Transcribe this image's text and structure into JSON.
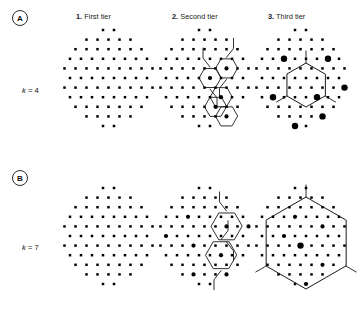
{
  "figure": {
    "background": "#ffffff",
    "ink": "#000000",
    "line_color": "#1a1a1a"
  },
  "panels": [
    {
      "id": "A",
      "badge_label": "A",
      "row_label_k": "k",
      "row_label_eq": " = ",
      "row_label_value": "4",
      "row_label_full": "k = 4",
      "cluster_size": 4
    },
    {
      "id": "B",
      "badge_label": "B",
      "row_label_k": "k",
      "row_label_eq": " = ",
      "row_label_value": "7",
      "row_label_full": "k = 7",
      "cluster_size": 7
    }
  ],
  "columns": [
    {
      "number": "1.",
      "label": "First tier"
    },
    {
      "number": "2.",
      "label": "Second tier"
    },
    {
      "number": "3.",
      "label": "Third tier"
    }
  ],
  "chart_data": {
    "type": "scatter",
    "title": "",
    "lattice": {
      "dx": 11,
      "dy": 9.6,
      "dot_radius_small": 1.25,
      "dot_radius_medium": 2.1,
      "dot_radius_large": 3.2,
      "rows": [
        {
          "y_index": 0,
          "count": 2,
          "x_start": 3.0
        },
        {
          "y_index": 1,
          "count": 5,
          "x_start": 1.5
        },
        {
          "y_index": 2,
          "count": 7,
          "x_start": 0.5
        },
        {
          "y_index": 3,
          "count": 8,
          "x_start": 0.0
        },
        {
          "y_index": 4,
          "count": 9,
          "x_start": -0.5
        },
        {
          "y_index": 5,
          "count": 8,
          "x_start": 0.0
        },
        {
          "y_index": 6,
          "count": 9,
          "x_start": -0.5
        },
        {
          "y_index": 7,
          "count": 8,
          "x_start": 0.0
        },
        {
          "y_index": 8,
          "count": 7,
          "x_start": 0.5
        },
        {
          "y_index": 9,
          "count": 5,
          "x_start": 1.5
        },
        {
          "y_index": 10,
          "count": 2,
          "x_start": 3.0
        }
      ]
    },
    "panel_A": {
      "k": 4,
      "tier1": {
        "marked": []
      },
      "tier2": {
        "cell_radius": 11.0,
        "centers": [
          {
            "cx": 44.5,
            "cy": 43.0
          },
          {
            "cx": 61.5,
            "cy": 33.6
          },
          {
            "cx": 44.5,
            "cy": 81.0
          },
          {
            "cx": 61.5,
            "cy": 90.5
          },
          {
            "cx": 53.0,
            "cy": 62.0
          }
        ],
        "marked_dots": [
          {
            "cx": 44.5,
            "cy": 43.0,
            "size": "medium"
          },
          {
            "cx": 61.5,
            "cy": 33.6,
            "size": "medium"
          },
          {
            "cx": 53.0,
            "cy": 62.0,
            "size": "medium"
          },
          {
            "cx": 44.5,
            "cy": 81.0,
            "size": "medium"
          },
          {
            "cx": 61.5,
            "cy": 90.5,
            "size": "medium"
          }
        ]
      },
      "tier3": {
        "cell_radius": 22.0,
        "marked_dots": [
          {
            "cx": 22.0,
            "cy": 24.0,
            "size": "large"
          },
          {
            "cx": 66.0,
            "cy": 24.0,
            "size": "large"
          },
          {
            "cx": 11.0,
            "cy": 62.0,
            "size": "large"
          },
          {
            "cx": 55.0,
            "cy": 62.0,
            "size": "large"
          },
          {
            "cx": 88.0,
            "cy": 62.0,
            "size": "large"
          },
          {
            "cx": 22.0,
            "cy": 100.0,
            "size": "large"
          },
          {
            "cx": 66.0,
            "cy": 100.0,
            "size": "large"
          }
        ]
      }
    },
    "panel_B": {
      "k": 7,
      "tier1": {
        "marked": []
      },
      "tier2": {
        "cell_radius": 15.5,
        "centers": [
          {
            "cx": 58.0,
            "cy": 36.0
          },
          {
            "cx": 58.0,
            "cy": 68.0
          }
        ],
        "marked_dots": [
          {
            "cx": 58.0,
            "cy": 36.0,
            "size": "medium"
          },
          {
            "cx": 58.0,
            "cy": 68.0,
            "size": "medium"
          },
          {
            "cx": 25.0,
            "cy": 27.0,
            "size": "medium"
          },
          {
            "cx": 25.0,
            "cy": 60.0,
            "size": "medium"
          },
          {
            "cx": 25.0,
            "cy": 92.0,
            "size": "medium"
          },
          {
            "cx": 0.0,
            "cy": 44.0,
            "size": "medium"
          },
          {
            "cx": 88.0,
            "cy": 44.0,
            "size": "medium"
          },
          {
            "cx": 58.0,
            "cy": 100.0,
            "size": "medium"
          }
        ]
      },
      "tier3": {
        "cell_radius": 46.0,
        "marked_dots": [
          {
            "cx": 44.0,
            "cy": 57.0,
            "size": "large"
          },
          {
            "cx": 33.0,
            "cy": 28.0,
            "size": "medium"
          },
          {
            "cx": 66.0,
            "cy": 38.0,
            "size": "medium"
          },
          {
            "cx": 22.0,
            "cy": 48.0,
            "size": "medium"
          },
          {
            "cx": 66.0,
            "cy": 76.0,
            "size": "medium"
          },
          {
            "cx": 44.0,
            "cy": 95.0,
            "size": "medium"
          }
        ]
      }
    }
  }
}
